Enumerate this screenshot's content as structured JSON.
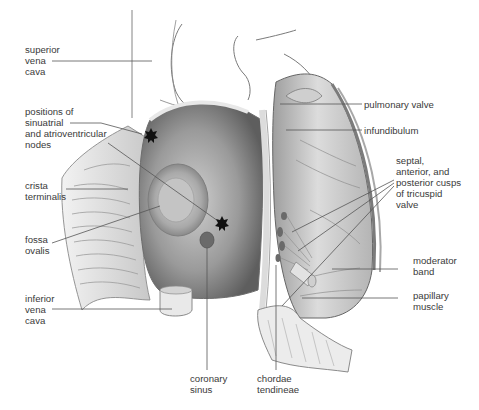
{
  "figure": {
    "colors": {
      "line": "#555555",
      "text": "#3a3a3a",
      "tissue_light": "#e6e6e6",
      "tissue_mid": "#bdbdbd",
      "tissue_dark": "#6e6e6e",
      "marker": "#111111"
    }
  },
  "labels": [
    {
      "id": "superior-vena-cava",
      "lines": [
        "superior",
        "vena",
        "cava"
      ]
    },
    {
      "id": "sa-av-nodes",
      "lines": [
        "positions of",
        "sinuatrial",
        "and atrioventricular",
        "nodes"
      ]
    },
    {
      "id": "crista-terminalis",
      "lines": [
        "crista",
        "terminalis"
      ]
    },
    {
      "id": "fossa-ovalis",
      "lines": [
        "fossa",
        "ovalis"
      ]
    },
    {
      "id": "inferior-vena-cava",
      "lines": [
        "inferior",
        "vena",
        "cava"
      ]
    },
    {
      "id": "coronary-sinus",
      "lines": [
        "coronary",
        "sinus"
      ]
    },
    {
      "id": "chordae-tendineae",
      "lines": [
        "chordae",
        "tendineae"
      ]
    },
    {
      "id": "pulmonary-valve",
      "lines": [
        "pulmonary valve"
      ]
    },
    {
      "id": "infundibulum",
      "lines": [
        "infundibulum"
      ]
    },
    {
      "id": "tricuspid-cusps",
      "lines": [
        "septal,",
        "anterior, and",
        "posterior cusps",
        "of tricuspid",
        "valve"
      ]
    },
    {
      "id": "moderator-band",
      "lines": [
        "moderator",
        "band"
      ]
    },
    {
      "id": "papillary-muscle",
      "lines": [
        "papillary",
        "muscle"
      ]
    }
  ],
  "markers": [
    {
      "name": "sinuatrial-node",
      "symbol": "star"
    },
    {
      "name": "atrioventricular-node",
      "symbol": "star"
    }
  ]
}
